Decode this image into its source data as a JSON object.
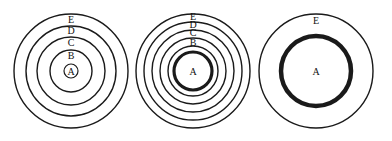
{
  "figure": {
    "panels": [
      {
        "id": "panel-1",
        "center": [
          71,
          71
        ],
        "rings": [
          {
            "label": "E",
            "r": 57,
            "stroke": 1.4
          },
          {
            "label": "D",
            "r": 45,
            "stroke": 1.4
          },
          {
            "label": "C",
            "r": 34,
            "stroke": 1.4
          },
          {
            "label": "B",
            "r": 21,
            "stroke": 1.4
          },
          {
            "label": "A",
            "r": 7,
            "stroke": 1.2
          }
        ],
        "labels": [
          {
            "text": "E",
            "x": 71,
            "y": 23
          },
          {
            "text": "D",
            "x": 71,
            "y": 34
          },
          {
            "text": "C",
            "x": 71,
            "y": 46
          },
          {
            "text": "B",
            "x": 71,
            "y": 59
          },
          {
            "text": "A",
            "x": 71,
            "y": 75
          }
        ]
      },
      {
        "id": "panel-2",
        "center": [
          193,
          71
        ],
        "rings": [
          {
            "label": "E",
            "r": 57,
            "stroke": 1.4
          },
          {
            "label": "D",
            "r": 49,
            "stroke": 1.4
          },
          {
            "label": "C",
            "r": 41,
            "stroke": 1.4
          },
          {
            "label": "B",
            "r": 33,
            "stroke": 1.4
          },
          {
            "label": "",
            "r": 25,
            "stroke": 1.4
          },
          {
            "label": "A",
            "r": 19,
            "stroke": 3.2
          }
        ],
        "labels": [
          {
            "text": "E",
            "x": 193,
            "y": 20
          },
          {
            "text": "D",
            "x": 193,
            "y": 28
          },
          {
            "text": "C",
            "x": 193,
            "y": 36
          },
          {
            "text": "B",
            "x": 193,
            "y": 46
          },
          {
            "text": "A",
            "x": 193,
            "y": 75
          }
        ]
      },
      {
        "id": "panel-3",
        "center": [
          316,
          71
        ],
        "rings": [
          {
            "label": "E",
            "r": 57,
            "stroke": 1.4
          },
          {
            "label": "A",
            "r": 35,
            "stroke": 4.5
          }
        ],
        "labels": [
          {
            "text": "E",
            "x": 316,
            "y": 24
          },
          {
            "text": "A",
            "x": 316,
            "y": 75
          }
        ]
      }
    ]
  }
}
